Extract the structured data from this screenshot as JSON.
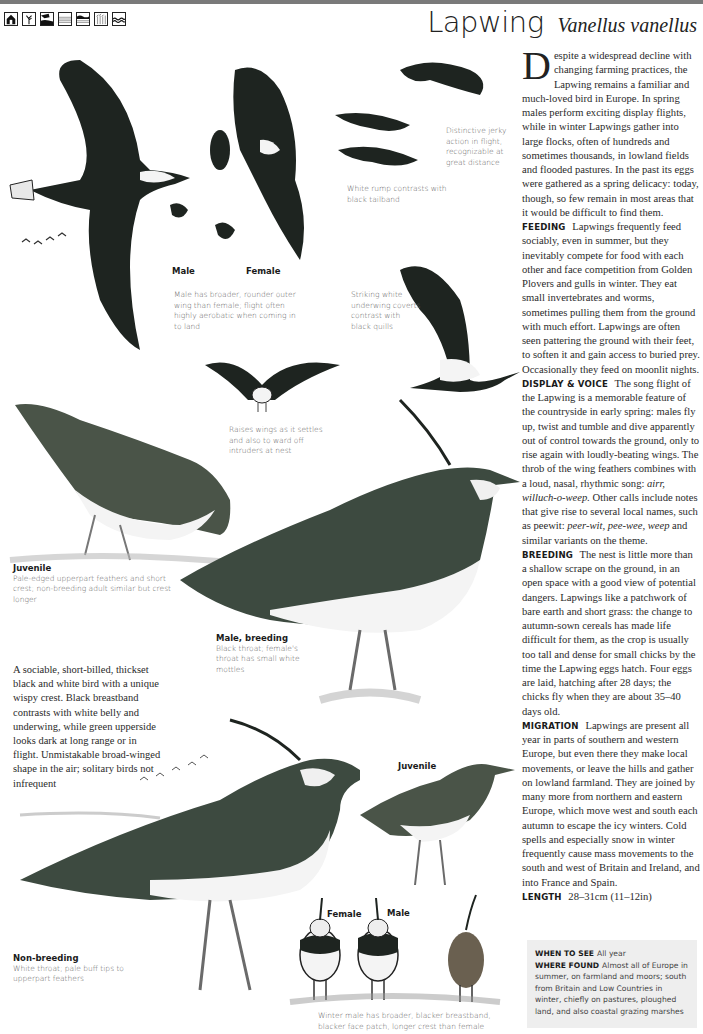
{
  "header": {
    "common_name": "Lapwing",
    "scientific_name": "Vanellus vanellus",
    "habitat_icons": [
      "urban-icon",
      "woodland-icon",
      "coast-icon",
      "farmland-icon",
      "wetland-icon",
      "grassland-icon",
      "water-icon"
    ]
  },
  "intro": {
    "dropcap": "D",
    "text": "espite a widespread decline with changing farming practices, the Lapwing remains a familiar and much-loved bird in Europe. In spring males perform exciting display flights, while in winter Lapwings gather into large flocks, often of hundreds and sometimes thousands, in lowland fields and flooded pastures. In the past its eggs were gathered as a spring delicacy: today, though, so few remain in most areas that it would be difficult to find them."
  },
  "sections": {
    "feeding": {
      "heading": "FEEDING",
      "text": "Lapwings frequently feed sociably, even in summer, but they inevitably compete for food with each other and face competition from Golden Plovers and gulls in winter. They eat small invertebrates and worms, sometimes pulling them from the ground with much effort. Lapwings are often seen pattering the ground with their feet, to soften it and gain access to buried prey. Occasionally they feed on moonlit nights."
    },
    "display_voice": {
      "heading": "DISPLAY & VOICE",
      "text_1": "The song flight of the Lapwing is a memorable feature of the countryside in early spring: males fly up, twist and tumble and dive apparently out of control towards the ground, only to rise again with loudly-beating wings. The throb of the wing feathers combines with a loud, nasal, rhythmic song: ",
      "song": "airr, willuch-o-weep.",
      "text_2": " Other calls include notes that give rise to several local names, such as peewit: ",
      "calls": "peer-wit, pee-wee, weep",
      "text_3": " and similar variants on the theme."
    },
    "breeding": {
      "heading": "BREEDING",
      "text": "The nest is little more than a shallow scrape on the ground, in an open space with a good view of potential dangers. Lapwings like a patchwork of bare earth and short grass: the change to autumn-sown cereals has made life difficult for them, as the crop is usually too tall and dense for small chicks by the time the Lapwing eggs hatch. Four eggs are laid, hatching after 28 days; the chicks fly when they are about 35–40 days old."
    },
    "migration": {
      "heading": "MIGRATION",
      "text": "Lapwings are present all year in parts of southern and western Europe, but even there they make local movements, or leave the hills and gather on lowland farmland. They are joined by many more from northern and eastern Europe, which move west and south each autumn to escape the icy winters. Cold spells and especially snow in winter frequently cause mass movements to the south and west of Britain and Ireland, and into France and Spain."
    },
    "length": {
      "heading": "LENGTH",
      "text": "28–31cm (11–12in)"
    }
  },
  "info_box": {
    "when_heading": "WHEN TO SEE",
    "when_text": "All year",
    "where_heading": "WHERE FOUND",
    "where_text": "Almost all of Europe in summer, on farmland and moors; south from Britain and Low Countries in winter, chiefly on pastures, ploughed land, and also coastal grazing marshes"
  },
  "summary": "A sociable, short-billed, thickset black and white bird with a unique wispy crest. Black breastband contrasts with white belly and underwing, while green upperside looks dark at long range or in flight. Unmistakable broad-winged shape in the air; solitary birds not infrequent",
  "captions": {
    "flight_jerky": "Distinctive jerky action in flight, recognizable at great distance",
    "white_rump": "White rump contrasts with black tailband",
    "male_label": "Male",
    "female_label": "Female",
    "wing_shape": "Male has broader, rounder outer wing than female; flight often highly aerobatic when coming in to land",
    "underwing": "Striking white underwing coverts contrast with black quills",
    "raises_wings": "Raises wings as it settles and also to ward off intruders at nest",
    "juvenile_title": "Juvenile",
    "juvenile_text": "Pale-edged upperpart feathers and short crest; non-breeding adult similar but crest longer",
    "male_breeding_title": "Male, breeding",
    "male_breeding_text": "Black throat; female's throat has small white mottles",
    "juvenile2_title": "Juvenile",
    "non_breeding_title": "Non-breeding",
    "non_breeding_text": "White throat; pale buff tips to upperpart feathers",
    "winter_female_label": "Female",
    "winter_male_label": "Male",
    "winter_caption": "Winter male has broader, blacker breastband, blacker face patch, longer crest than female"
  },
  "colors": {
    "top_bar": "#7a7a7a",
    "info_box_bg": "#eeeeee",
    "bird_dark": "#1e2420",
    "bird_green": "#4a5448",
    "caption_gray": "#666666"
  }
}
